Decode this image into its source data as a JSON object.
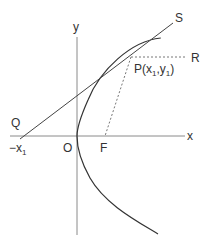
{
  "diagram": {
    "type": "parabola-tangent",
    "colors": {
      "axis": "#888888",
      "curve": "#333333",
      "tangent": "#444444",
      "dashed": "#777777",
      "text": "#333333"
    },
    "labels": {
      "y_axis": "y",
      "x_axis": "x",
      "S": "S",
      "R": "R",
      "P_main": "P(x",
      "P_sub1": "1",
      "P_mid": ",y",
      "P_sub2": "1",
      "P_end": ")",
      "Q": "Q",
      "neg_x_main": "−x",
      "neg_x_sub": "1",
      "O": "O",
      "F": "F"
    },
    "points": {
      "origin": [
        77,
        136
      ],
      "P": [
        131,
        57
      ],
      "Q": [
        23,
        136
      ],
      "F": [
        106,
        136
      ],
      "R_end": [
        187,
        57
      ],
      "S_end": [
        173,
        23
      ]
    }
  }
}
